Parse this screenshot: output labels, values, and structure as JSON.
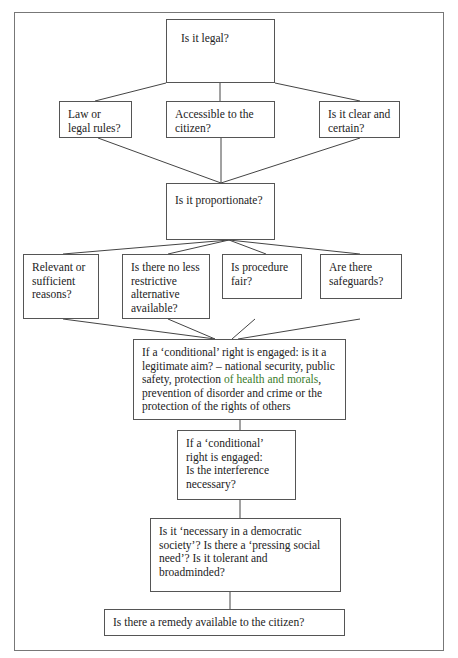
{
  "diagram": {
    "type": "flowchart",
    "nodes": {
      "legal": {
        "label": "Is it legal?"
      },
      "law": {
        "label": "Law or legal rules?"
      },
      "accessible": {
        "label": "Accessible to the citizen?"
      },
      "clear": {
        "label": "Is it clear and certain?"
      },
      "proportionate": {
        "label": "Is it proportionate?"
      },
      "relevant": {
        "label": "Relevant or sufficient reasons?"
      },
      "less_restrictive": {
        "label": "Is there no less restrictive alternative available?"
      },
      "procedure": {
        "label": "Is procedure fair?"
      },
      "safeguards": {
        "label": "Are there safeguards?"
      },
      "legitimate_aim": {
        "label_part1": "If a ‘conditional’ right is engaged: is it a legitimate aim? – national security, public safety, protection ",
        "label_highlight": "of health and morals",
        "label_part2": ", prevention of disorder and crime or the protection of the rights of others",
        "highlight_color": "#3a7a2a"
      },
      "interference": {
        "line1": "If a ‘conditional’ right is engaged:",
        "line2": "Is the interference necessary?"
      },
      "democratic": {
        "label": "Is it ‘necessary in a democratic society’? Is there a ‘pressing social need’? Is it tolerant and broadminded?"
      },
      "remedy": {
        "label": "Is there a remedy available to the citizen?"
      }
    },
    "edges": [
      [
        "legal",
        "law"
      ],
      [
        "legal",
        "accessible"
      ],
      [
        "legal",
        "clear"
      ],
      [
        "law",
        "proportionate"
      ],
      [
        "accessible",
        "proportionate"
      ],
      [
        "clear",
        "proportionate"
      ],
      [
        "proportionate",
        "relevant"
      ],
      [
        "proportionate",
        "less_restrictive"
      ],
      [
        "proportionate",
        "procedure"
      ],
      [
        "proportionate",
        "safeguards"
      ],
      [
        "relevant",
        "legitimate_aim"
      ],
      [
        "less_restrictive",
        "legitimate_aim"
      ],
      [
        "procedure",
        "legitimate_aim"
      ],
      [
        "safeguards",
        "legitimate_aim"
      ],
      [
        "legitimate_aim",
        "interference"
      ],
      [
        "interference",
        "democratic"
      ],
      [
        "democratic",
        "remedy"
      ]
    ]
  }
}
